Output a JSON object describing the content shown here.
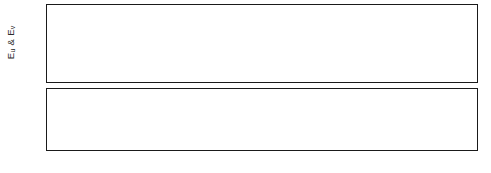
{
  "figure": {
    "title": "",
    "background": "#ffffff",
    "line_color": "#1a1a1a"
  },
  "panels": {
    "top": {
      "name": "upper-panel",
      "ylabel": "E",
      "ylabel_sub_a": "u",
      "ylabel_amp": " & E",
      "ylabel_sub_b": "v",
      "ylabel_full": "Eu & Ev",
      "yticks": [
        "0.0",
        "0.2",
        "0.4",
        "0.6",
        "0.8",
        "1.0",
        "1.2"
      ],
      "ylim_min": 0.0,
      "ylim_max": 1.25,
      "minor_tick_step": 0.05
    },
    "bottom": {
      "name": "lower-panel",
      "ylabel": "P & D",
      "yticks": [
        "0.0",
        "0.1",
        "0.2",
        "0.3",
        "0.4",
        "0.5",
        "0.6",
        "0.7"
      ],
      "ylim_min": 0.0,
      "ylim_max": 0.75,
      "minor_tick_step": 0.025
    },
    "shared_x": {
      "xticks": [
        "0",
        "10",
        "20",
        "30",
        "40",
        "50"
      ],
      "xlim_min": 0,
      "xlim_max": 50,
      "xlabel": ""
    }
  },
  "chart_data": {
    "type": "line",
    "title": "",
    "xlabel": "",
    "xlim": [
      0,
      50
    ],
    "grid": false,
    "legend": "none",
    "subplots": [
      {
        "name": "upper-panel",
        "ylabel": "Eu & Ev",
        "ylim": [
          0.0,
          1.25
        ],
        "yticks": [
          0.0,
          0.2,
          0.4,
          0.6,
          0.8,
          1.0,
          1.2
        ],
        "xticks": [
          0,
          10,
          20,
          30,
          40,
          50
        ],
        "series": [
          {
            "name": "Eu",
            "style": "solid",
            "color": "#1a1a1a",
            "description": "oscillation rising from 0, peaks near 1.20, troughs near 0.30, period about 4.55",
            "period": 4.55,
            "peak": 1.2,
            "trough": 0.3,
            "phase": 0.0
          },
          {
            "name": "Ev",
            "style": "solid",
            "color": "#1a1a1a",
            "description": "near overlap of Eu at peaks, separates at troughs reaching about 0.18",
            "period": 4.55,
            "peak": 1.19,
            "trough": 0.18,
            "phase": 0.0
          },
          {
            "name": "Edot",
            "style": "dotted",
            "color": "#555555",
            "description": "small amplitude ripple at double frequency peaking near 0.15 at solid troughs",
            "period": 2.275,
            "peak": 0.15,
            "trough": 0.0,
            "phase": 0.0
          }
        ]
      },
      {
        "name": "lower-panel",
        "ylabel": "P & D",
        "ylim": [
          0.0,
          0.75
        ],
        "yticks": [
          0.0,
          0.1,
          0.2,
          0.3,
          0.4,
          0.5,
          0.6,
          0.7
        ],
        "xticks": [
          0,
          10,
          20,
          30,
          40,
          50
        ],
        "series": [
          {
            "name": "P",
            "style": "solid",
            "color": "#1a1a1a",
            "description": "rectified narrow lobes starting at peak 0.70 at x=0, returning to 0 between lobes, period about 4.55",
            "period": 4.55,
            "peak": 0.7,
            "trough": 0.0,
            "phase": 0.0
          },
          {
            "name": "D",
            "style": "dotted",
            "color": "#555555",
            "description": "rectified narrow lobes offset half a period from P, peak 0.70",
            "period": 4.55,
            "peak": 0.7,
            "trough": 0.0,
            "phase": 2.275
          },
          {
            "name": "baseline",
            "style": "solid",
            "color": "#1a1a1a",
            "description": "small slow undulation hugging the zero axis with amplitude under 0.02",
            "period": 4.55,
            "peak": 0.02,
            "trough": 0.0,
            "phase": 0.0
          }
        ]
      }
    ]
  }
}
